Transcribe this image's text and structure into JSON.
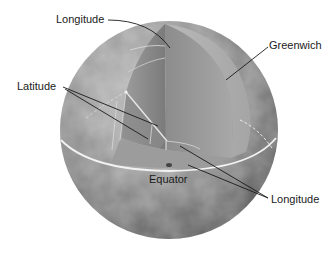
{
  "figure": {
    "labels": {
      "longitude_top": "Longitude",
      "greenwich": "Greenwich",
      "latitude": "Latitude",
      "equator": "Equator",
      "longitude_bottom": "Longitude"
    }
  },
  "colors": {
    "background": "#ffffff",
    "sphere_light": "#b5b5b5",
    "sphere_dark": "#5a5a5a",
    "cut_face_light": "#c8c8c8",
    "cut_face_mid": "#9a9a9a",
    "cut_face_dark": "#7a7a7a",
    "equator_line": "#f2f2f2",
    "leader_line": "#1a1a1a",
    "text": "#1a1a1a"
  }
}
